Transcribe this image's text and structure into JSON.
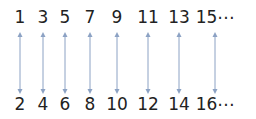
{
  "diagram": {
    "arrow_color": "#8ca2c4",
    "text_color": "#222222",
    "columns": [
      {
        "x": 20,
        "top": "1",
        "bottom": "2"
      },
      {
        "x": 43,
        "top": "3",
        "bottom": "4"
      },
      {
        "x": 65,
        "top": "5",
        "bottom": "6"
      },
      {
        "x": 90,
        "top": "7",
        "bottom": "8"
      },
      {
        "x": 117,
        "top": "9",
        "bottom": "10"
      },
      {
        "x": 148,
        "top": "11",
        "bottom": "12"
      },
      {
        "x": 179,
        "top": "13",
        "bottom": "14"
      },
      {
        "x": 215,
        "top": "15⋯",
        "bottom": "16⋯"
      }
    ]
  }
}
